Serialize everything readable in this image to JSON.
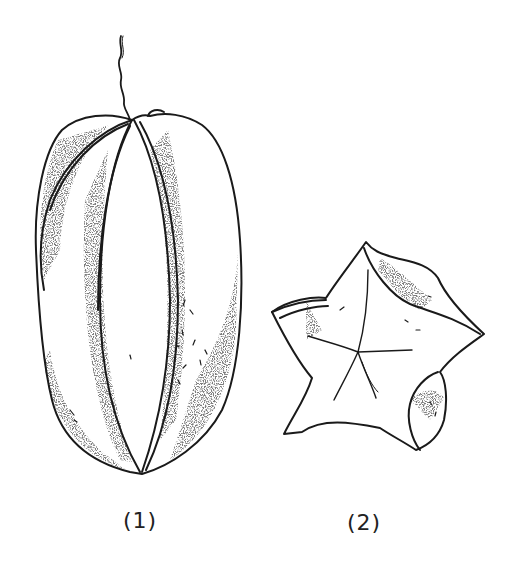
{
  "illustration": {
    "subject": "carambola (star fruit) line drawing",
    "figures": [
      {
        "id": "side-view",
        "caption": "(1)"
      },
      {
        "id": "cross-section",
        "caption": "(2)"
      }
    ]
  },
  "colors": {
    "ink": "#1a1a1a",
    "stipple": "#555555",
    "background": "#ffffff"
  }
}
